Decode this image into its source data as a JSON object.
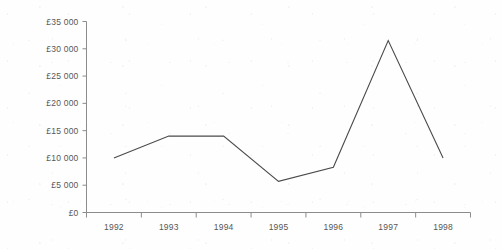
{
  "chart_data": {
    "type": "line",
    "title": "",
    "subtitle": "",
    "xlabel": "",
    "ylabel": "",
    "categories": [
      "1992",
      "1993",
      "1994",
      "1995",
      "1996",
      "1997",
      "1998"
    ],
    "x": [
      1992,
      1993,
      1994,
      1995,
      1996,
      1997,
      1998
    ],
    "values": [
      10000,
      14000,
      14000,
      5700,
      8300,
      31500,
      10000
    ],
    "series": [
      {
        "name": "",
        "values": [
          10000,
          14000,
          14000,
          5700,
          8300,
          31500,
          10000
        ]
      }
    ],
    "ylim": [
      0,
      35000
    ],
    "y_tick_values": [
      0,
      5000,
      10000,
      15000,
      20000,
      25000,
      30000,
      35000
    ],
    "y_tick_labels": [
      "£0",
      "£5 000",
      "£10 000",
      "£15 000",
      "£20 000",
      "£25 000",
      "£30 000",
      "£35 000"
    ],
    "x_tick_labels": [
      "1992",
      "1993",
      "1994",
      "1995",
      "1996",
      "1997",
      "1998"
    ],
    "grid": false,
    "legend": false,
    "legend_position": "none",
    "annotations": [],
    "colors": {
      "line": "#4a4a4a",
      "axis": "#8c8c8c",
      "text": "#575757",
      "background": "#fefefe"
    }
  }
}
